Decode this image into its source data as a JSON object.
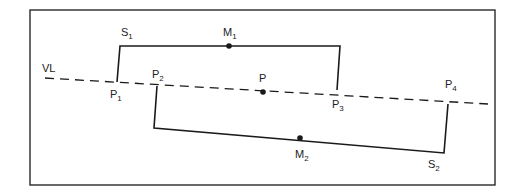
{
  "diagram": {
    "frame": {
      "x": 30,
      "y": 10,
      "width": 465,
      "height": 175
    },
    "colors": {
      "stroke": "#1a1a1a",
      "text": "#222222",
      "background": "#ffffff"
    },
    "view_line": {
      "label": "VL",
      "x1": 45,
      "y1": 78,
      "x2": 488,
      "y2": 104,
      "style": "dashed"
    },
    "center_point": {
      "label": "P",
      "x": 263,
      "y": 92
    },
    "segment_1": {
      "label": "S",
      "label_sub": "1",
      "midpoint": {
        "label": "M",
        "sub": "1",
        "x": 229,
        "y": 46
      },
      "points": [
        {
          "label": "P",
          "sub": "1",
          "x": 117,
          "y": 82
        },
        {
          "label": "P",
          "sub": "3",
          "x": 337,
          "y": 90
        }
      ]
    },
    "segment_2": {
      "label": "S",
      "label_sub": "2",
      "midpoint": {
        "label": "M",
        "sub": "2",
        "x": 300,
        "y": 138
      },
      "points": [
        {
          "label": "P",
          "sub": "2",
          "x": 157,
          "y": 86
        },
        {
          "label": "P",
          "sub": "4",
          "x": 448,
          "y": 104
        }
      ]
    }
  }
}
